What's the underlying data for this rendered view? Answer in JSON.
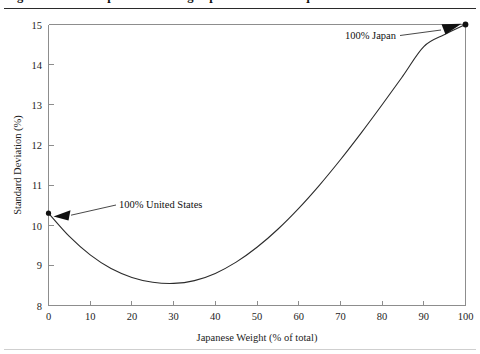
{
  "figure": {
    "title_partial": "Figure 1. Risk of a portfolio mixing Japanese and U.S. equities",
    "title_visible": false
  },
  "chart_data": {
    "type": "line",
    "title": "",
    "xlabel": "Japanese Weight (% of total)",
    "ylabel": "Standard Deviation (%)",
    "xlim": [
      0,
      100
    ],
    "ylim": [
      8,
      15
    ],
    "xticks": [
      0,
      10,
      20,
      30,
      40,
      50,
      60,
      70,
      80,
      90,
      100
    ],
    "yticks": [
      8,
      9,
      10,
      11,
      12,
      13,
      14,
      15
    ],
    "xtick_labels": [
      "0",
      "10",
      "20",
      "30",
      "40",
      "50",
      "60",
      "70",
      "80",
      "90",
      "100"
    ],
    "ytick_labels": [
      "8",
      "9",
      "10",
      "11",
      "12",
      "13",
      "14",
      "15"
    ],
    "grid": false,
    "legend": "none",
    "series": [
      {
        "name": "Portfolio standard deviation",
        "color": "#2b2b2b",
        "x": [
          0,
          5,
          10,
          15,
          20,
          25,
          30,
          35,
          40,
          45,
          50,
          55,
          60,
          65,
          70,
          75,
          80,
          85,
          90,
          95,
          100
        ],
        "values": [
          10.3,
          9.72,
          9.26,
          8.92,
          8.7,
          8.58,
          8.55,
          8.62,
          8.8,
          9.08,
          9.45,
          9.9,
          10.42,
          11.0,
          11.63,
          12.3,
          13.0,
          13.72,
          14.45,
          14.75,
          15.0
        ]
      }
    ],
    "points": [
      {
        "name": "100% United States",
        "x": 0,
        "y": 10.3,
        "label": "100% United States",
        "marker": "dot"
      },
      {
        "name": "100% Japan",
        "x": 100,
        "y": 15.0,
        "label": "100% Japan",
        "marker": "dot"
      }
    ],
    "annotations": [
      {
        "text": "100% United States",
        "points_to": "100% United States",
        "arrow_direction": "left"
      },
      {
        "text": "100% Japan",
        "points_to": "100% Japan",
        "arrow_direction": "up-right"
      }
    ],
    "minimum_variance_point": {
      "x": 30,
      "y": 8.55
    }
  },
  "colors": {
    "curve": "#2b2b2b",
    "axis": "#8d8d8d",
    "text": "#1d1d1d",
    "rule": "#2a2a2a",
    "background": "#ffffff"
  }
}
